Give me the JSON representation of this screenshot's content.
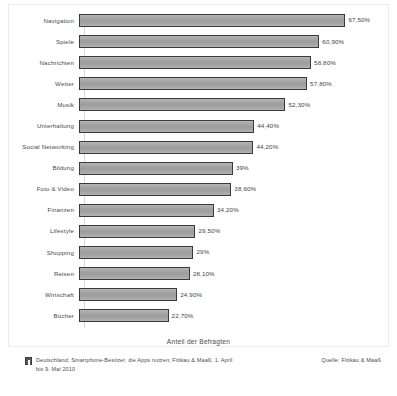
{
  "chart_data": {
    "type": "bar",
    "orientation": "horizontal",
    "title": "",
    "xlabel": "Anteil der Befragten",
    "ylabel": "",
    "xlim": [
      0,
      75
    ],
    "grid": false,
    "legend": "none",
    "categories": [
      "Navigation",
      "Spiele",
      "Nachrichten",
      "Wetter",
      "Musik",
      "Unterhaltung",
      "Social Networking",
      "Bildung",
      "Foto & Video",
      "Finanzen",
      "Lifestyle",
      "Shopping",
      "Reisen",
      "Wirtschaft",
      "Bücher"
    ],
    "values": [
      67.5,
      60.9,
      58.8,
      57.8,
      52.3,
      44.4,
      44.2,
      39,
      38.6,
      34.2,
      29.5,
      29,
      28.1,
      24.9,
      22.7
    ],
    "value_labels": [
      "67,50%",
      "60,90%",
      "58,80%",
      "57,80%",
      "52,30%",
      "44,40%",
      "44,20%",
      "39%",
      "38,60%",
      "34,20%",
      "29,50%",
      "29%",
      "28,10%",
      "24,90%",
      "22,70%"
    ],
    "bar_color": "#a5a5a5",
    "bar_border_color": "#3a3a3a"
  },
  "axis": {
    "x_title": "Anteil der Befragten"
  },
  "footer": {
    "note": "Deutschland; Smartphone-Besitzer, die Apps nutzen; Fittkau & Maaß; 1. April bis 9. Mai 2010",
    "source": "Quelle: Fittkau & Maaß",
    "info_icon": "info-icon"
  }
}
